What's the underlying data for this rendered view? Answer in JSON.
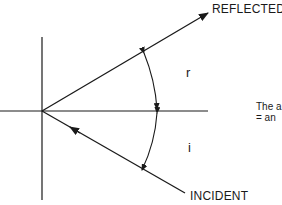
{
  "diagram": {
    "labels": {
      "reflected": "REFLECTED",
      "incident": "INCIDENT",
      "angle_reflected": "r",
      "angle_incident": "i"
    },
    "caption": {
      "line1": "The a",
      "line2": "= an"
    },
    "colors": {
      "ink": "#1a1a1a",
      "background": "#ffffff"
    },
    "geometry": {
      "origin": [
        42,
        111
      ],
      "mirror_x": 42,
      "normal_y": 111,
      "reflected_end": [
        208,
        13
      ],
      "incident_start": [
        185,
        193
      ]
    }
  }
}
